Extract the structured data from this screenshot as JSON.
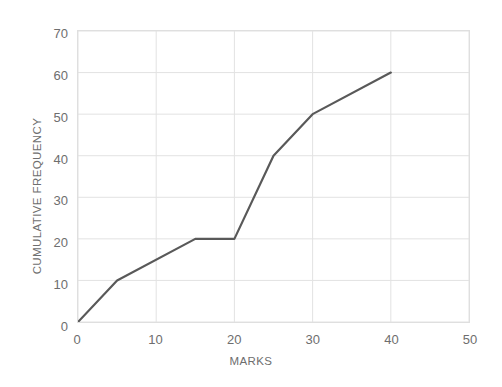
{
  "chart_data": {
    "type": "line",
    "title": "",
    "xlabel": "MARKS",
    "ylabel": "CUMULATIVE FREQUENCY",
    "xlim": [
      0,
      50
    ],
    "ylim": [
      0,
      70
    ],
    "xticks": [
      0,
      10,
      20,
      30,
      40,
      50
    ],
    "yticks": [
      0,
      10,
      20,
      30,
      40,
      50,
      60,
      70
    ],
    "grid": true,
    "legend": "none",
    "series": [
      {
        "name": "Cumulative frequency",
        "color": "#595959",
        "x": [
          0,
          5,
          15,
          20,
          25,
          30,
          40
        ],
        "y": [
          0,
          10,
          20,
          20,
          40,
          50,
          60
        ],
        "points": [
          {
            "x": 0,
            "y": 0
          },
          {
            "x": 5,
            "y": 10
          },
          {
            "x": 15,
            "y": 20
          },
          {
            "x": 20,
            "y": 20
          },
          {
            "x": 25,
            "y": 40
          },
          {
            "x": 30,
            "y": 50
          },
          {
            "x": 40,
            "y": 60
          }
        ]
      }
    ]
  },
  "style": {
    "background": "#ffffff",
    "grid_color": "#e2e2e2",
    "border_color": "#dfdfdf",
    "tick_color": "#6e6e6e",
    "line_color": "#595959"
  }
}
